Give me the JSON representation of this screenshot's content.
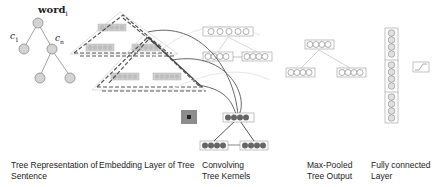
{
  "tree_representation": {
    "root_label": "word",
    "root_subscript": "i",
    "left_child_label": "c",
    "left_child_subscript": "1",
    "right_child_label": "c",
    "right_child_subscript": "n"
  },
  "captions": [
    {
      "line1": "Tree Representation of",
      "line2": "Sentence"
    },
    {
      "line1": "Embedding Layer of Tree",
      "line2": ""
    },
    {
      "line1": "Convolving",
      "line2": "Tree Kernels"
    },
    {
      "line1": "Max-Pooled",
      "line2": "Tree Output"
    },
    {
      "line1": "Fully connected",
      "line2": "Layer"
    }
  ],
  "icons": {
    "node": "tree-node-circle",
    "vector": "embedding-vector",
    "kernel": "convolution-kernel-square",
    "softmax": "activation-function-box"
  },
  "colors": {
    "node_fill": "#d4d4d4",
    "node_stroke": "#8a8a8a",
    "dashed_line": "#555555",
    "curve": "#555555",
    "filled_node": "#666666",
    "kernel_square": "#8c8c8c"
  }
}
